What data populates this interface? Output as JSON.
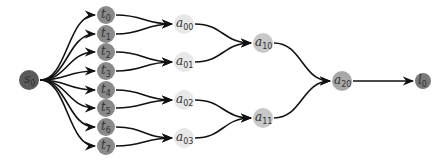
{
  "diagram": {
    "type": "tree",
    "colors": {
      "s": "#5a5a5a",
      "t": "#8a8a8a",
      "a0": "#e8e8e8",
      "a1": "#c8c8c8",
      "a2": "#a8a8a8",
      "l": "#7a7a7a",
      "edge": "#111111"
    },
    "nodes": [
      {
        "id": "s0",
        "base": "s",
        "sub": "0",
        "x": 29,
        "y": 80,
        "r": 10,
        "level": "s"
      },
      {
        "id": "t0",
        "base": "t",
        "sub": "0",
        "x": 106,
        "y": 15,
        "r": 9,
        "level": "t"
      },
      {
        "id": "t1",
        "base": "t",
        "sub": "1",
        "x": 106,
        "y": 34,
        "r": 9,
        "level": "t"
      },
      {
        "id": "t2",
        "base": "t",
        "sub": "2",
        "x": 106,
        "y": 52,
        "r": 9,
        "level": "t"
      },
      {
        "id": "t3",
        "base": "t",
        "sub": "3",
        "x": 106,
        "y": 71,
        "r": 9,
        "level": "t"
      },
      {
        "id": "t4",
        "base": "t",
        "sub": "4",
        "x": 106,
        "y": 90,
        "r": 9,
        "level": "t"
      },
      {
        "id": "t5",
        "base": "t",
        "sub": "5",
        "x": 106,
        "y": 108,
        "r": 9,
        "level": "t"
      },
      {
        "id": "t6",
        "base": "t",
        "sub": "6",
        "x": 106,
        "y": 127,
        "r": 9,
        "level": "t"
      },
      {
        "id": "t7",
        "base": "t",
        "sub": "7",
        "x": 106,
        "y": 146,
        "r": 9,
        "level": "t"
      },
      {
        "id": "a00",
        "base": "a",
        "sub": "00",
        "x": 184,
        "y": 24,
        "r": 10,
        "level": "a0"
      },
      {
        "id": "a01",
        "base": "a",
        "sub": "01",
        "x": 184,
        "y": 62,
        "r": 10,
        "level": "a0"
      },
      {
        "id": "a02",
        "base": "a",
        "sub": "02",
        "x": 184,
        "y": 100,
        "r": 10,
        "level": "a0"
      },
      {
        "id": "a03",
        "base": "a",
        "sub": "03",
        "x": 184,
        "y": 138,
        "r": 10,
        "level": "a0"
      },
      {
        "id": "a10",
        "base": "a",
        "sub": "10",
        "x": 263,
        "y": 43,
        "r": 10,
        "level": "a1"
      },
      {
        "id": "a11",
        "base": "a",
        "sub": "11",
        "x": 263,
        "y": 118,
        "r": 10,
        "level": "a1"
      },
      {
        "id": "a20",
        "base": "a",
        "sub": "20",
        "x": 342,
        "y": 81,
        "r": 10,
        "level": "a2"
      },
      {
        "id": "l0",
        "base": "l",
        "sub": "0",
        "x": 423,
        "y": 81,
        "r": 8,
        "level": "l"
      }
    ],
    "edges": [
      [
        "s0",
        "t0"
      ],
      [
        "s0",
        "t1"
      ],
      [
        "s0",
        "t2"
      ],
      [
        "s0",
        "t3"
      ],
      [
        "s0",
        "t4"
      ],
      [
        "s0",
        "t5"
      ],
      [
        "s0",
        "t6"
      ],
      [
        "s0",
        "t7"
      ],
      [
        "t0",
        "a00"
      ],
      [
        "t1",
        "a00"
      ],
      [
        "t2",
        "a01"
      ],
      [
        "t3",
        "a01"
      ],
      [
        "t4",
        "a02"
      ],
      [
        "t5",
        "a02"
      ],
      [
        "t6",
        "a03"
      ],
      [
        "t7",
        "a03"
      ],
      [
        "a00",
        "a10"
      ],
      [
        "a01",
        "a10"
      ],
      [
        "a02",
        "a11"
      ],
      [
        "a03",
        "a11"
      ],
      [
        "a10",
        "a20"
      ],
      [
        "a11",
        "a20"
      ],
      [
        "a20",
        "l0"
      ]
    ]
  }
}
